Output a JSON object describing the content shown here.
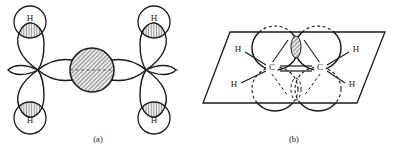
{
  "figure": {
    "background_color": "#ffffff",
    "stroke_color": "#1a1a1a",
    "hatch_color": "#4a4a4a",
    "dash_color": "#555555",
    "width": 394,
    "height": 157
  },
  "panels": [
    {
      "id": "panel-a",
      "caption": "(a)",
      "caption_x": 98,
      "caption_y": 140,
      "description": "Side/end view of ethylene showing two sp2 carbons, four hydrogen 1s orbitals overlapping sp2 lobes, and the central pi overlap region",
      "carbon_nodes": [
        {
          "name": "carbon-left",
          "cx": 38,
          "cy": 70
        },
        {
          "name": "carbon-right",
          "cx": 146,
          "cy": 70
        }
      ],
      "pi_overlap": {
        "name": "pi-overlap-region",
        "cx": 92,
        "cy": 70,
        "rx": 22,
        "ry": 22,
        "fill": "hatched"
      },
      "sigma_axis": {
        "name": "sigma-bond-axis",
        "x1": 10,
        "y1": 70,
        "x2": 176,
        "y2": 70,
        "style": "dashed"
      },
      "hydrogens": [
        {
          "label": "H",
          "name": "hydrogen-top-left",
          "cx": 30,
          "cy": 22,
          "r": 16,
          "label_x": 30,
          "label_y": 19
        },
        {
          "label": "H",
          "name": "hydrogen-bottom-left",
          "cx": 30,
          "cy": 118,
          "r": 16,
          "label_x": 30,
          "label_y": 121
        },
        {
          "label": "H",
          "name": "hydrogen-top-right",
          "cx": 154,
          "cy": 22,
          "r": 16,
          "label_x": 154,
          "label_y": 19
        },
        {
          "label": "H",
          "name": "hydrogen-bottom-right",
          "cx": 154,
          "cy": 118,
          "r": 16,
          "label_x": 154,
          "label_y": 121
        }
      ],
      "sp2_lobes": [
        {
          "name": "sp2-lobe-top-left",
          "from_x": 38,
          "from_y": 70,
          "to_x": 26,
          "to_y": 30
        },
        {
          "name": "sp2-lobe-bottom-left",
          "from_x": 38,
          "from_y": 70,
          "to_x": 26,
          "to_y": 110
        },
        {
          "name": "sp2-lobe-top-right",
          "from_x": 146,
          "from_y": 70,
          "to_x": 158,
          "to_y": 30
        },
        {
          "name": "sp2-lobe-bottom-right",
          "from_x": 146,
          "from_y": 70,
          "to_x": 158,
          "to_y": 110
        }
      ]
    },
    {
      "id": "panel-b",
      "caption": "(b)",
      "caption_x": 294,
      "caption_y": 140,
      "description": "Perspective view showing the planar sigma framework with two p orbitals above and below the molecular plane forming the pi bond",
      "plane": {
        "name": "molecular-plane",
        "points": "230,32 385,32 357,103 203,103"
      },
      "carbons": [
        {
          "label": "C",
          "name": "carbon-label-left",
          "x": 272,
          "y": 68
        },
        {
          "label": "C",
          "name": "carbon-label-right",
          "x": 320,
          "y": 68
        }
      ],
      "hydrogens": [
        {
          "label": "H",
          "name": "hydrogen-upper-left",
          "x": 238,
          "y": 50,
          "bond_x1": 245,
          "bond_y1": 52,
          "bond_x2": 265,
          "bond_y2": 66
        },
        {
          "label": "H",
          "name": "hydrogen-lower-left",
          "x": 234,
          "y": 85,
          "bond_x1": 241,
          "bond_y1": 83,
          "bond_x2": 265,
          "bond_y2": 71
        },
        {
          "label": "H",
          "name": "hydrogen-upper-right",
          "x": 356,
          "y": 50,
          "bond_x1": 349,
          "bond_y1": 52,
          "bond_x2": 327,
          "bond_y2": 66
        },
        {
          "label": "H",
          "name": "hydrogen-lower-right",
          "x": 352,
          "y": 85,
          "bond_x1": 345,
          "bond_y1": 83,
          "bond_x2": 327,
          "bond_y2": 71
        }
      ],
      "p_lobes": [
        {
          "name": "p-lobe-left-upper",
          "cx": 275,
          "cy": 48,
          "rx": 23,
          "ry": 22,
          "position": "above-plane"
        },
        {
          "name": "p-lobe-right-upper",
          "cx": 318,
          "cy": 48,
          "rx": 23,
          "ry": 22,
          "position": "above-plane"
        },
        {
          "name": "p-lobe-left-lower",
          "cx": 275,
          "cy": 89,
          "rx": 23,
          "ry": 22,
          "position": "below-plane"
        },
        {
          "name": "p-lobe-right-lower",
          "cx": 318,
          "cy": 89,
          "rx": 23,
          "ry": 22,
          "position": "below-plane"
        }
      ],
      "pi_overlap": {
        "name": "pi-overlap-region",
        "cx": 296,
        "cy": 46,
        "rx": 5,
        "ry": 11,
        "fill": "hatched"
      }
    }
  ]
}
